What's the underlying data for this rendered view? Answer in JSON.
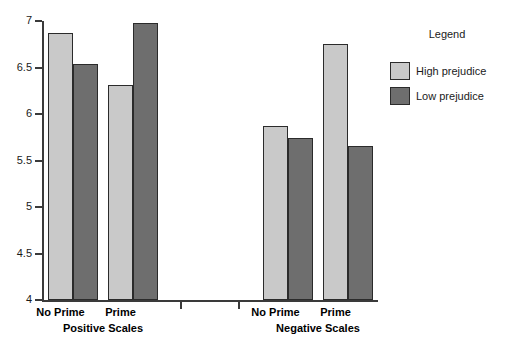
{
  "chart_data": {
    "type": "bar",
    "title": "",
    "xlabel": "",
    "ylabel": "",
    "ylim": [
      4,
      7
    ],
    "ytick_labels": [
      "4",
      "4.5",
      "5",
      "5.5",
      "6",
      "6.5",
      "7"
    ],
    "ytick_values": [
      4,
      4.5,
      5,
      5.5,
      6,
      6.5,
      7
    ],
    "grid": false,
    "legend_position": "right",
    "categories": [
      "No Prime",
      "Prime",
      "No Prime",
      "Prime"
    ],
    "groups": [
      {
        "label": "Positive Scales",
        "categories": [
          "No Prime",
          "Prime"
        ]
      },
      {
        "label": "Negative Scales",
        "categories": [
          "No Prime",
          "Prime"
        ]
      }
    ],
    "series": [
      {
        "name": "High prejudice",
        "color": "#c9c9c9",
        "values": [
          6.87,
          6.31,
          5.87,
          6.75
        ]
      },
      {
        "name": "Low prejudice",
        "color": "#6e6e6e",
        "values": [
          6.54,
          6.98,
          5.74,
          5.66
        ]
      }
    ],
    "bars": [
      {
        "group": "Positive Scales",
        "category": "No Prime",
        "series": "High prejudice",
        "value": 6.87,
        "color": "#c9c9c9",
        "x": 48,
        "width": 25
      },
      {
        "group": "Positive Scales",
        "category": "No Prime",
        "series": "Low prejudice",
        "value": 6.54,
        "color": "#6e6e6e",
        "x": 73,
        "width": 25
      },
      {
        "group": "Positive Scales",
        "category": "Prime",
        "series": "High prejudice",
        "value": 6.31,
        "color": "#c9c9c9",
        "x": 108,
        "width": 25
      },
      {
        "group": "Positive Scales",
        "category": "Prime",
        "series": "Low prejudice",
        "value": 6.98,
        "color": "#6e6e6e",
        "x": 133,
        "width": 25
      },
      {
        "group": "Negative Scales",
        "category": "No Prime",
        "series": "High prejudice",
        "value": 5.87,
        "color": "#c9c9c9",
        "x": 263,
        "width": 25
      },
      {
        "group": "Negative Scales",
        "category": "No Prime",
        "series": "Low prejudice",
        "value": 5.74,
        "color": "#6e6e6e",
        "x": 288,
        "width": 25
      },
      {
        "group": "Negative Scales",
        "category": "Prime",
        "series": "High prejudice",
        "value": 6.75,
        "color": "#c9c9c9",
        "x": 323,
        "width": 25
      },
      {
        "group": "Negative Scales",
        "category": "Prime",
        "series": "Low prejudice",
        "value": 5.66,
        "color": "#6e6e6e",
        "x": 348,
        "width": 25
      }
    ],
    "category_label_positions": [
      60.5,
      120.5,
      275.5,
      335.5
    ],
    "group_label_positions": [
      103,
      318
    ],
    "separator_ticks": [
      180,
      238
    ]
  },
  "legend": {
    "title": "Legend",
    "entries": [
      {
        "label": "High prejudice",
        "color": "#c9c9c9"
      },
      {
        "label": "Low prejudice",
        "color": "#6e6e6e"
      }
    ]
  },
  "axis": {
    "y_min": 4,
    "y_max": 7,
    "y_top_px": 21,
    "y_bottom_px": 300
  }
}
